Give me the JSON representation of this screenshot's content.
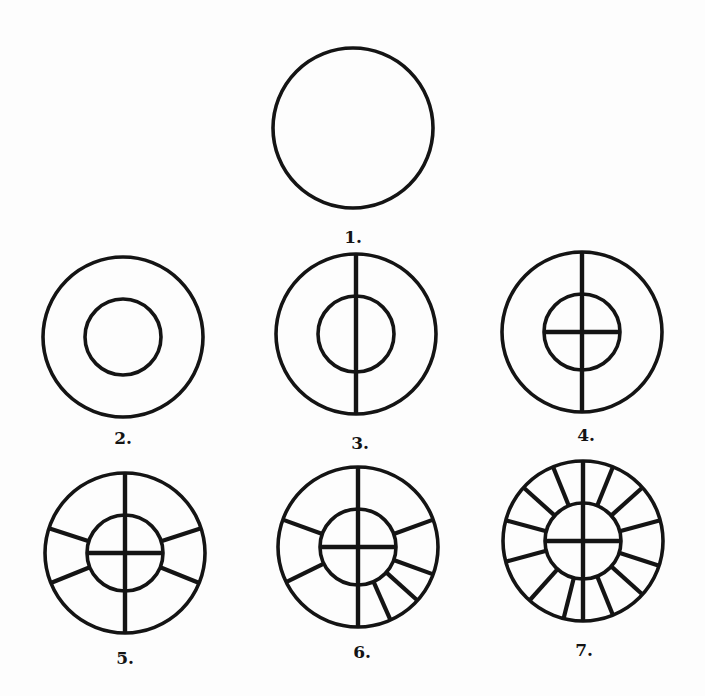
{
  "figure": {
    "stroke_color": "#141414",
    "background": "#fdfdfd",
    "stages": [
      {
        "id": 1,
        "label": "1.",
        "cx": 353,
        "cy": 128,
        "r_outer": 80,
        "r_inner": 0,
        "vertical": false,
        "horizontal": false,
        "spokes": [],
        "label_x": 353,
        "label_y": 243
      },
      {
        "id": 2,
        "label": "2.",
        "cx": 123,
        "cy": 337,
        "r_outer": 80,
        "r_inner": 38,
        "vertical": false,
        "horizontal": false,
        "spokes": [],
        "label_x": 123,
        "label_y": 444
      },
      {
        "id": 3,
        "label": "3.",
        "cx": 356,
        "cy": 334,
        "r_outer": 80,
        "r_inner": 38,
        "vertical": true,
        "horizontal": false,
        "spokes": [],
        "label_x": 360,
        "label_y": 449
      },
      {
        "id": 4,
        "label": "4.",
        "cx": 582,
        "cy": 332,
        "r_outer": 80,
        "r_inner": 38,
        "vertical": true,
        "horizontal": true,
        "spokes": [],
        "label_x": 586,
        "label_y": 441
      },
      {
        "id": 5,
        "label": "5.",
        "cx": 125,
        "cy": 553,
        "r_outer": 80,
        "r_inner": 38,
        "vertical": true,
        "horizontal": true,
        "spokes": [
          18,
          162,
          202,
          338
        ],
        "label_x": 125,
        "label_y": 664
      },
      {
        "id": 6,
        "label": "6.",
        "cx": 358,
        "cy": 547,
        "r_outer": 80,
        "r_inner": 38,
        "vertical": true,
        "horizontal": true,
        "spokes": [
          20,
          160,
          206,
          294,
          318,
          340
        ],
        "label_x": 362,
        "label_y": 658
      },
      {
        "id": 7,
        "label": "7.",
        "cx": 583,
        "cy": 541,
        "r_outer": 80,
        "r_inner": 38,
        "vertical": true,
        "horizontal": true,
        "spokes": [
          15,
          42,
          68,
          112,
          138,
          165,
          195,
          228,
          256,
          292,
          318,
          342
        ],
        "label_x": 584,
        "label_y": 656
      }
    ]
  }
}
